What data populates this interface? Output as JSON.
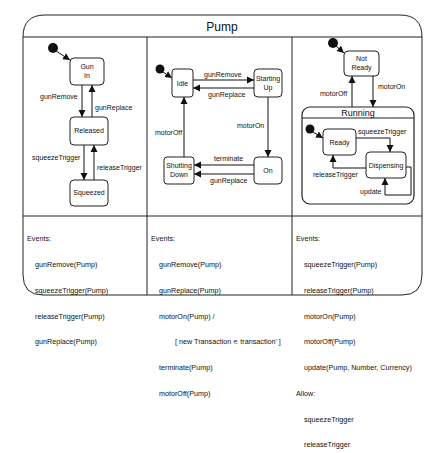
{
  "title": "Pump",
  "panels": [
    {
      "states": [
        {
          "id": "gun_in",
          "label1": "Gun",
          "label2": "In"
        },
        {
          "id": "released",
          "label1": "Released"
        },
        {
          "id": "squeezed",
          "label1": "Squeezed"
        }
      ],
      "transitions": {
        "gunRemove": "gunRemove",
        "gunReplace": "gunReplace",
        "squeezeTrigger": "squeezeTrigger",
        "releaseTrigger": "releaseTrigger"
      },
      "events_header": "Events:",
      "events": [
        "gunRemove(Pump)",
        "squeezeTrigger(Pump)",
        "releaseTrigger(Pump)",
        "gunReplace(Pump)"
      ]
    },
    {
      "states": [
        {
          "id": "idle",
          "label1": "Idle"
        },
        {
          "id": "starting_up",
          "label1": "Starting",
          "label2": "Up"
        },
        {
          "id": "shutting_down",
          "label1": "Shutting",
          "label2": "Down"
        },
        {
          "id": "on",
          "label1": "On"
        }
      ],
      "transitions": {
        "gunRemove": "gunRemove",
        "gunReplace": "gunReplace",
        "motorOn": "motorOn",
        "motorOff": "motorOff",
        "terminate": "terminate",
        "gunReplace2": "gunReplace"
      },
      "events_header": "Events:",
      "events": [
        "gunRemove(Pump)",
        "gunReplace(Pump)",
        "motorOn(Pump) /"
      ],
      "events_guard": "[ new Transaction ∊ transaction' ]",
      "events_tail": [
        "terminate(Pump)",
        "motorOff(Pump)"
      ]
    },
    {
      "states": [
        {
          "id": "not_ready",
          "label1": "Not",
          "label2": "Ready"
        },
        {
          "id": "running",
          "label1": "Running"
        },
        {
          "id": "ready",
          "label1": "Ready"
        },
        {
          "id": "dispensing",
          "label1": "Dispensing"
        }
      ],
      "transitions": {
        "motorOff": "motorOff",
        "motorOn": "motorOn",
        "squeezeTrigger": "squeezeTrigger",
        "releaseTrigger": "releaseTrigger",
        "update": "update"
      },
      "events_header": "Events:",
      "events": [
        "squeezeTrigger(Pump)",
        "releaseTrigger(Pump)",
        "motorOn(Pump)",
        "motorOff(Pump)",
        "update(Pump, Number, Currency)"
      ],
      "allow_header": "Allow:",
      "allow": [
        "squeezeTrigger",
        "releaseTrigger"
      ]
    }
  ]
}
